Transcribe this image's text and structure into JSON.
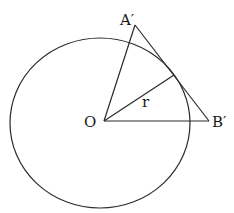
{
  "diagram": {
    "labels": {
      "A": "A′",
      "B": "B′",
      "O": "O",
      "r": "r"
    },
    "colors": {
      "stroke": "#2a2a2a",
      "text": "#1a1a1a",
      "background": "#ffffff"
    }
  }
}
